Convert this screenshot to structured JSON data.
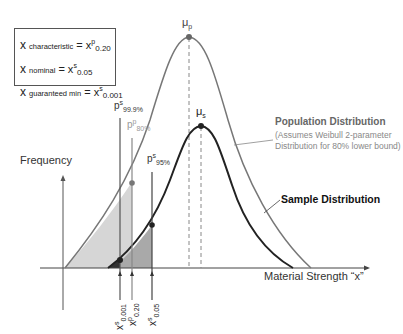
{
  "legend": {
    "lines": [
      {
        "x": "x",
        "sub": "characteristic",
        "eq": " = x",
        "sup": "p",
        "isub": "0.20"
      },
      {
        "x": "x",
        "sub": "nominal",
        "eq": " = x",
        "sup": "s",
        "isub": "0.05"
      },
      {
        "x": "x",
        "sub": "guaranteed min",
        "eq": " = x",
        "sup": "s",
        "isub": "0.001"
      }
    ]
  },
  "axes": {
    "y_label": "Frequency",
    "x_label": "Material Strength “x”"
  },
  "means": {
    "population": {
      "symbol": "μ",
      "sub": "p"
    },
    "sample": {
      "symbol": "μ",
      "sub": "s"
    }
  },
  "percentile_labels": {
    "ps999": {
      "p": "p",
      "sup": "s",
      "sub": "99.9%"
    },
    "pp80": {
      "p": "p",
      "sup": "p",
      "sub": "80%"
    },
    "ps95": {
      "p": "p",
      "sup": "s",
      "sub": "95%"
    }
  },
  "x_markers": {
    "xs0001": {
      "x": "x",
      "sup": "s",
      "sub": "0.001"
    },
    "xp020": {
      "x": "x",
      "sup": "p",
      "sub": "0.20"
    },
    "xs005": {
      "x": "x",
      "sup": "s",
      "sub": "0.05"
    }
  },
  "annotations": {
    "population_title": "Population Distribution",
    "population_desc": "(Assumes Weibull 2-parameter Distribution for 80% lower bound)",
    "sample_title": "Sample Distribution"
  },
  "colors": {
    "population_curve": "#777777",
    "sample_curve": "#222222",
    "shade_light": "#d4d4d4",
    "shade_mid": "#a8a8a8",
    "shade_dark": "#333333"
  }
}
